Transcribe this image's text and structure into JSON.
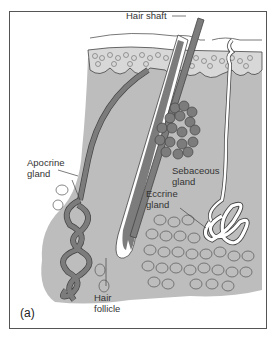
{
  "figure": {
    "panel_label": "(a)",
    "labels": {
      "hair_shaft": "Hair shaft",
      "sebaceous_line1": "Sebaceous",
      "sebaceous_line2": "gland",
      "apocrine_line1": "Apocrine",
      "apocrine_line2": "gland",
      "eccrine_line1": "Eccrine",
      "eccrine_line2": "gland",
      "follicle_line1": "Hair",
      "follicle_line2": "follicle"
    },
    "colors": {
      "tissue": "#bdbdbd",
      "dark_structure": "#7c7c7c",
      "outline": "#444444",
      "background": "#ffffff"
    }
  }
}
